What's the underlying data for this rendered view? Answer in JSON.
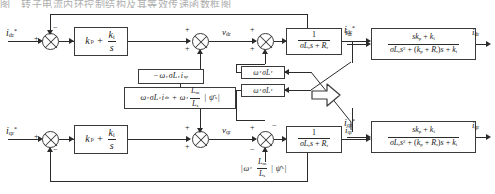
{
  "diagram": {
    "title_strip": "图　转子电流内环控制结构及其等效传递函数框图",
    "type": "control-block-diagram",
    "line_color": "#2b2b2b",
    "box_border_color": "#3a3a3a",
    "background": "#ffffff"
  },
  "channels": {
    "d_axis": {
      "reference_label": "i*dr",
      "reference_html": "<span class=\"m\">i</span><sub>dr</sub><sup>*</sup>",
      "controller_label": "kp + ki/s",
      "intermediate_voltage": "vdr",
      "plant_label": "1/(σLr s + Rr)",
      "output_label": "idr",
      "feedforward_1": "-ωr σLr iqr",
      "feedforward_2": "ωr σLr idr + ωr (Lm/Ls)|ψs|",
      "decoupling_box": "ωr σLr"
    },
    "q_axis": {
      "reference_label": "i*qr",
      "reference_html": "<span class=\"m\">i</span><sub>qr</sub><sup>*</sup>",
      "controller_label": "kp + ki/s",
      "intermediate_voltage": "vqr",
      "plant_label": "1/(σLr s + Rr)",
      "output_label": "iqr",
      "feedforward_1": "ωr (Lm/Ls)|ψs|",
      "decoupling_box": "ωr σLr"
    }
  },
  "equivalent": {
    "arrow_symbol": "⇒",
    "d_axis": {
      "input_label": "i*dr",
      "transfer_numerator": "s kp + ki",
      "transfer_denominator": "σLr s² + (kp + Rr)s + ki",
      "output_label": "idr"
    },
    "q_axis": {
      "input_label": "i*qr",
      "transfer_numerator": "s kp + ki",
      "transfer_denominator": "σLr s² + (kp + Rr)s + ki",
      "output_label": "iqr"
    }
  },
  "signs": {
    "plus": "+",
    "minus": "−"
  }
}
